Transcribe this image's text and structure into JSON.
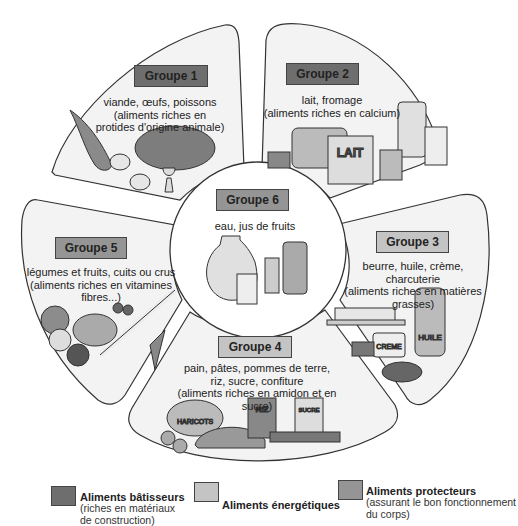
{
  "colors": {
    "batisseurs": "#6e6e6e",
    "energetiques": "#c4c4c4",
    "protecteurs": "#959595",
    "petal_fill": "#f2f2f2",
    "outline": "#333333"
  },
  "groups": [
    {
      "label": "Groupe 1",
      "desc": "viande, œufs, poissons\n(aliments riches en\nprotides d'origine animale)",
      "category": "batisseurs",
      "icon": "meat-fish-eggs-icon"
    },
    {
      "label": "Groupe 2",
      "desc": "lait, fromage\n(aliments riches en calcium)",
      "category": "batisseurs",
      "icon": "dairy-icon"
    },
    {
      "label": "Groupe 3",
      "desc": "beurre, huile, crème, charcuterie\n(aliments riches  en matières\ngrasses)",
      "category": "energetiques",
      "icon": "fats-icon"
    },
    {
      "label": "Groupe 4",
      "desc": "pain, pâtes, pommes de terre,\nriz, sucre, confiture\n(aliments riches en amidon et en sucre)",
      "category": "energetiques",
      "icon": "starch-sugar-icon"
    },
    {
      "label": "Groupe 5",
      "desc": "légumes et fruits, cuits ou crus\n(aliments riches en vitamines\nfibres...)",
      "category": "protecteurs",
      "icon": "vegetables-fruits-icon"
    },
    {
      "label": "Groupe 6",
      "desc": "eau, jus de fruits",
      "category": "protecteurs",
      "icon": "drinks-icon"
    }
  ],
  "illustration_labels": {
    "lait_carton": "LAIT",
    "huile_bottle": "HUILE",
    "creme_pot": "CREME",
    "riz_bag": "RIZ",
    "haricots_bag": "HARICOTS",
    "sucre_box": "SUCRE"
  },
  "legend": [
    {
      "title": "Aliments bâtisseurs",
      "subtitle": "(riches en matériaux\n   de construction)",
      "category": "batisseurs"
    },
    {
      "title": "Aliments énergétiques",
      "subtitle": "",
      "category": "energetiques"
    },
    {
      "title": "Aliments protecteurs",
      "subtitle": "(assurant le bon fonctionnement\n                   du corps)",
      "category": "protecteurs"
    }
  ]
}
